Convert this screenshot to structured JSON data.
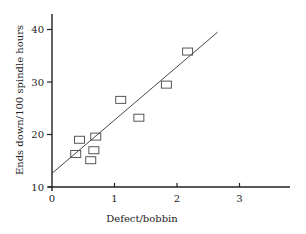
{
  "chart_data": {
    "type": "scatter",
    "title": "",
    "xlabel": "Defect/bobbin",
    "ylabel": "Ends down/100 spindle hours",
    "xlim": [
      0,
      3.8
    ],
    "ylim": [
      10,
      42
    ],
    "xticks": [
      0,
      1,
      2,
      3
    ],
    "yticks": [
      10,
      20,
      30,
      40
    ],
    "grid": false,
    "legend": null,
    "marker": "open-rectangle",
    "series": [
      {
        "name": "observations",
        "points": [
          {
            "x": 0.38,
            "y": 16.3
          },
          {
            "x": 0.44,
            "y": 19.0
          },
          {
            "x": 0.62,
            "y": 15.1
          },
          {
            "x": 0.67,
            "y": 17.0
          },
          {
            "x": 0.7,
            "y": 19.6
          },
          {
            "x": 1.1,
            "y": 26.6
          },
          {
            "x": 1.39,
            "y": 23.2
          },
          {
            "x": 1.83,
            "y": 29.5
          },
          {
            "x": 2.17,
            "y": 35.8
          }
        ]
      }
    ],
    "fit_line": {
      "x0": 0,
      "y0": 12.6,
      "x1": 2.65,
      "y1": 39.5
    }
  }
}
